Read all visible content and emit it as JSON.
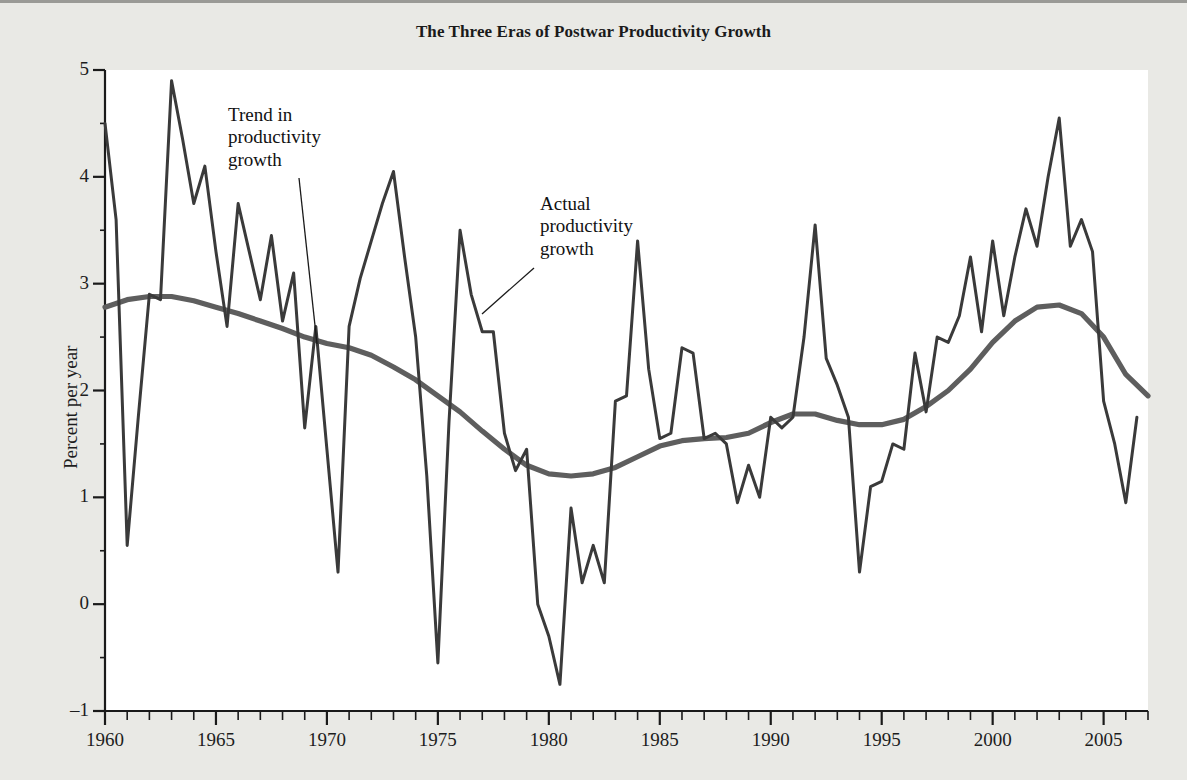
{
  "chart_data": {
    "type": "line",
    "title": "The Three Eras of Postwar Productivity Growth",
    "xlabel": "",
    "ylabel": "Percent per year",
    "xlim": [
      1960,
      2007
    ],
    "ylim": [
      -1,
      5
    ],
    "grid": false,
    "legend_position": "none",
    "y_ticks": [
      "5",
      "4",
      "3",
      "2",
      "1",
      "0",
      "-1"
    ],
    "y_tick_values": [
      5,
      4,
      3,
      2,
      1,
      0,
      -1
    ],
    "x_ticks": [
      "1960",
      "1965",
      "1970",
      "1975",
      "1980",
      "1985",
      "1990",
      "1995",
      "2000",
      "2005"
    ],
    "x_tick_values": [
      1960,
      1965,
      1970,
      1975,
      1980,
      1985,
      1990,
      1995,
      2000,
      2005
    ],
    "x_minor_tick_step": 1,
    "colors": {
      "actual": "#3a3a3a",
      "trend": "#5e5e5e",
      "axis": "#1a1a1a",
      "plot_background": "#ffffff",
      "page_background": "#e9e9e5"
    },
    "series": [
      {
        "name": "Actual productivity growth",
        "color": "#3a3a3a",
        "x": [
          1960.0,
          1960.5,
          1961.0,
          1961.5,
          1962.0,
          1962.5,
          1963.0,
          1963.5,
          1964.0,
          1964.5,
          1965.0,
          1965.5,
          1966.0,
          1966.5,
          1967.0,
          1967.5,
          1968.0,
          1968.5,
          1969.0,
          1969.5,
          1970.0,
          1970.5,
          1971.0,
          1971.5,
          1972.0,
          1972.5,
          1973.0,
          1973.5,
          1974.0,
          1974.5,
          1975.0,
          1975.5,
          1976.0,
          1976.5,
          1977.0,
          1977.5,
          1978.0,
          1978.5,
          1979.0,
          1979.5,
          1980.0,
          1980.5,
          1981.0,
          1981.5,
          1982.0,
          1982.5,
          1983.0,
          1983.5,
          1984.0,
          1984.5,
          1985.0,
          1985.5,
          1986.0,
          1986.5,
          1987.0,
          1987.5,
          1988.0,
          1988.5,
          1989.0,
          1989.5,
          1990.0,
          1990.5,
          1991.0,
          1991.5,
          1992.0,
          1992.5,
          1993.0,
          1993.5,
          1994.0,
          1994.5,
          1995.0,
          1995.5,
          1996.0,
          1996.5,
          1997.0,
          1997.5,
          1998.0,
          1998.5,
          1999.0,
          1999.5,
          2000.0,
          2000.5,
          2001.0,
          2001.5,
          2002.0,
          2002.5,
          2003.0,
          2003.5,
          2004.0,
          2004.5,
          2005.0,
          2005.5,
          2006.0,
          2006.5
        ],
        "y": [
          4.5,
          3.6,
          0.55,
          1.75,
          2.9,
          2.85,
          4.9,
          4.35,
          3.75,
          4.1,
          3.3,
          2.6,
          3.75,
          3.3,
          2.85,
          3.45,
          2.65,
          3.1,
          1.65,
          2.6,
          1.45,
          0.3,
          2.6,
          3.05,
          3.4,
          3.75,
          4.05,
          3.25,
          2.5,
          1.2,
          -0.55,
          1.7,
          3.5,
          2.9,
          2.55,
          2.55,
          1.6,
          1.25,
          1.45,
          0.0,
          -0.3,
          -0.75,
          0.9,
          0.2,
          0.55,
          0.2,
          1.9,
          1.95,
          3.4,
          2.2,
          1.55,
          1.6,
          2.4,
          2.35,
          1.55,
          1.6,
          1.5,
          0.95,
          1.3,
          1.0,
          1.75,
          1.65,
          1.75,
          2.5,
          3.55,
          2.3,
          2.05,
          1.75,
          0.3,
          1.1,
          1.15,
          1.5,
          1.45,
          2.35,
          1.8,
          2.5,
          2.45,
          2.7,
          3.25,
          2.55,
          3.4,
          2.7,
          3.25,
          3.7,
          3.35,
          4.0,
          4.55,
          3.35,
          3.6,
          3.3,
          1.9,
          1.5,
          0.95,
          1.75
        ]
      },
      {
        "name": "Trend in productivity growth",
        "color": "#5e5e5e",
        "x": [
          1960,
          1961,
          1962,
          1963,
          1964,
          1965,
          1966,
          1967,
          1968,
          1969,
          1970,
          1971,
          1972,
          1973,
          1974,
          1975,
          1976,
          1977,
          1978,
          1979,
          1980,
          1981,
          1982,
          1983,
          1984,
          1985,
          1986,
          1987,
          1988,
          1989,
          1990,
          1991,
          1992,
          1993,
          1994,
          1995,
          1996,
          1997,
          1998,
          1999,
          2000,
          2001,
          2002,
          2003,
          2004,
          2005,
          2006,
          2007
        ],
        "y": [
          2.78,
          2.85,
          2.88,
          2.88,
          2.84,
          2.78,
          2.72,
          2.65,
          2.58,
          2.5,
          2.44,
          2.4,
          2.33,
          2.22,
          2.1,
          1.95,
          1.8,
          1.62,
          1.45,
          1.3,
          1.22,
          1.2,
          1.22,
          1.28,
          1.38,
          1.48,
          1.53,
          1.55,
          1.56,
          1.6,
          1.7,
          1.78,
          1.78,
          1.72,
          1.68,
          1.68,
          1.73,
          1.85,
          2.0,
          2.2,
          2.45,
          2.65,
          2.78,
          2.8,
          2.72,
          2.5,
          2.15,
          1.95
        ]
      }
    ],
    "annotations": [
      {
        "id": "trend-annotation",
        "text": "Trend in\nproductivity\ngrowth",
        "label_x_px": 228,
        "label_y_px": 104,
        "leader": {
          "x1": 299,
          "y1": 178,
          "x2": 317,
          "y2": 344
        }
      },
      {
        "id": "actual-annotation",
        "text": "Actual\nproductivity\ngrowth",
        "label_x_px": 540,
        "label_y_px": 193,
        "leader": {
          "x1": 534,
          "y1": 268,
          "x2": 482,
          "y2": 314
        }
      }
    ]
  }
}
